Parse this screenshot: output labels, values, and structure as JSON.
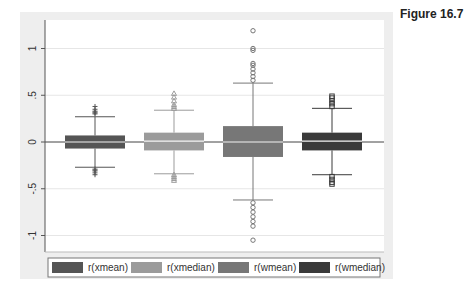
{
  "figure": {
    "title": "Figure 16.7"
  },
  "chart_data": {
    "type": "box",
    "title": "",
    "xlabel": "",
    "ylabel": "",
    "ylim": [
      -1.17,
      1.3
    ],
    "yticks": [
      -1,
      -0.5,
      0,
      0.5,
      1
    ],
    "ytick_labels": [
      "-1",
      "-.5",
      "0",
      ".5",
      "1"
    ],
    "grid": true,
    "reference_line": 0,
    "legend_position": "bottom",
    "series": [
      {
        "name": "r(xmean)",
        "color": "#555555",
        "q1": -0.07,
        "median": 0.0,
        "q3": 0.07,
        "whisker_low": -0.27,
        "whisker_high": 0.27,
        "outliers_high": [
          0.3,
          0.31,
          0.32,
          0.33,
          0.35,
          0.38
        ],
        "outliers_low": [
          -0.29,
          -0.3,
          -0.31,
          -0.33,
          -0.35
        ],
        "outlier_marker": "plus"
      },
      {
        "name": "r(xmedian)",
        "color": "#9b9b9b",
        "q1": -0.09,
        "median": 0.01,
        "q3": 0.1,
        "whisker_low": -0.34,
        "whisker_high": 0.34,
        "outliers_high": [
          0.36,
          0.38,
          0.4,
          0.44,
          0.48,
          0.52
        ],
        "outliers_low": [
          -0.35,
          -0.37,
          -0.39,
          -0.41
        ],
        "outlier_marker": "triangle"
      },
      {
        "name": "r(wmean)",
        "color": "#777777",
        "q1": -0.16,
        "median": 0.0,
        "q3": 0.17,
        "whisker_low": -0.62,
        "whisker_high": 0.63,
        "outliers_high": [
          0.66,
          0.7,
          0.74,
          0.78,
          0.82,
          0.84,
          0.98,
          1.0,
          1.19
        ],
        "outliers_low": [
          -0.65,
          -0.7,
          -0.75,
          -0.8,
          -0.85,
          -0.9,
          -1.05
        ],
        "outlier_marker": "circle"
      },
      {
        "name": "r(wmedian)",
        "color": "#3a3a3a",
        "q1": -0.09,
        "median": 0.01,
        "q3": 0.1,
        "whisker_low": -0.35,
        "whisker_high": 0.36,
        "outliers_high": [
          0.38,
          0.41,
          0.44,
          0.47,
          0.49
        ],
        "outliers_low": [
          -0.37,
          -0.4,
          -0.43,
          -0.45
        ],
        "outlier_marker": "square"
      }
    ]
  },
  "legend": {
    "items": [
      {
        "label": "r(xmean)",
        "color": "#555555"
      },
      {
        "label": "r(xmedian)",
        "color": "#9b9b9b"
      },
      {
        "label": "r(wmean)",
        "color": "#777777"
      },
      {
        "label": "r(wmedian)",
        "color": "#3a3a3a"
      }
    ]
  }
}
